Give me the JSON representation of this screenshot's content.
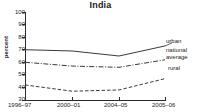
{
  "chart_data": {
    "type": "line",
    "title": "India",
    "xlabel": "",
    "ylabel": "percent",
    "categories": [
      "1996–97",
      "2000–01",
      "2004–05",
      "2005–06"
    ],
    "ylim": [
      30,
      100
    ],
    "yticks": [
      100,
      90,
      80,
      70,
      60,
      50,
      40,
      30
    ],
    "grid": false,
    "legend_position": "right-inline-annotations",
    "series": [
      {
        "name": "urban",
        "values": [
          70,
          69,
          65,
          73
        ],
        "style": "solid"
      },
      {
        "name": "national average",
        "values": [
          60,
          57,
          56,
          62
        ],
        "style": "dash-dot"
      },
      {
        "name": "rural",
        "values": [
          42,
          37,
          38,
          47
        ],
        "style": "dashed"
      }
    ],
    "annotations": [
      {
        "label": "urban"
      },
      {
        "label": "national"
      },
      {
        "label": "average"
      },
      {
        "label": "rural"
      }
    ]
  },
  "colors": {
    "axis": "#2b2b2b",
    "series_line": "#3a3a3a",
    "text": "#1a1a1a",
    "background": "#ffffff"
  }
}
